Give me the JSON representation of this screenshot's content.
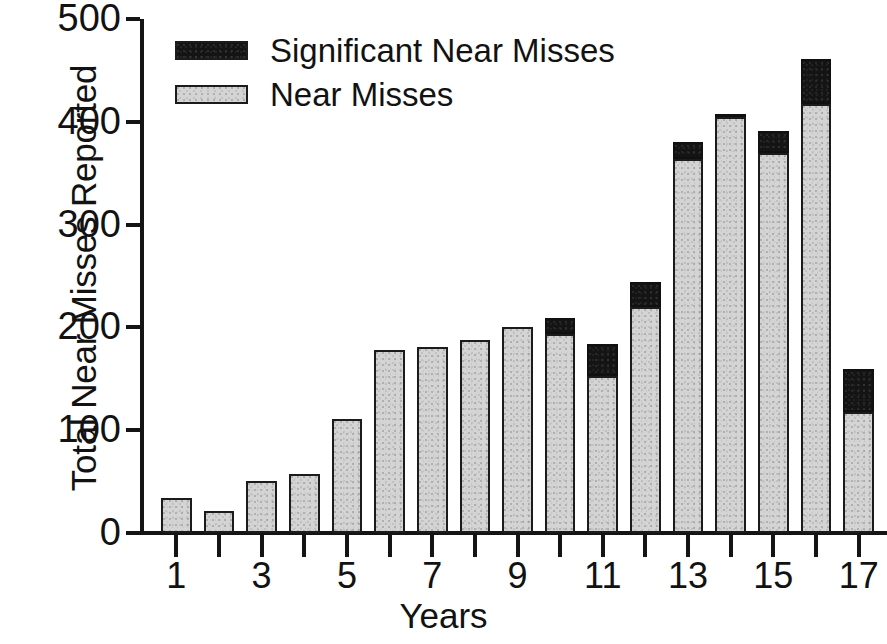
{
  "chart_data": {
    "type": "bar",
    "stacked": true,
    "title": "",
    "xlabel": "Years",
    "ylabel": "Total Near Misses Reported",
    "categories": [
      "1",
      "2",
      "3",
      "4",
      "5",
      "6",
      "7",
      "8",
      "9",
      "10",
      "11",
      "12",
      "13",
      "14",
      "15",
      "16",
      "17"
    ],
    "x_tick_labels": [
      "1",
      "3",
      "5",
      "7",
      "9",
      "11",
      "13",
      "15",
      "17"
    ],
    "y_tick_labels": [
      "0",
      "100",
      "200",
      "300",
      "400",
      "500"
    ],
    "xlim": [
      0.4,
      17.6
    ],
    "ylim": [
      0,
      500
    ],
    "grid": false,
    "legend_position": "top-left",
    "series": [
      {
        "name": "Near Misses",
        "color": "#d4d4d4",
        "values": [
          34,
          21,
          51,
          57,
          111,
          178,
          181,
          188,
          200,
          194,
          153,
          220,
          364,
          405,
          370,
          417,
          118
        ]
      },
      {
        "name": "Significant Near Misses",
        "color": "#141414",
        "values": [
          0,
          0,
          0,
          0,
          0,
          0,
          0,
          0,
          0,
          15,
          31,
          24,
          16,
          3,
          21,
          44,
          42
        ]
      }
    ],
    "totals": [
      34,
      21,
      51,
      57,
      111,
      178,
      181,
      188,
      200,
      209,
      184,
      244,
      380,
      408,
      391,
      461,
      160
    ]
  },
  "legend": {
    "items": [
      {
        "label": "Significant Near Misses",
        "swatch": "sig"
      },
      {
        "label": "Near Misses",
        "swatch": "near"
      }
    ]
  }
}
